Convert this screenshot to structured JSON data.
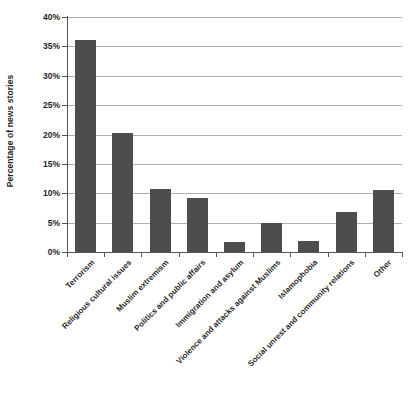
{
  "chart_data": {
    "type": "bar",
    "title": "",
    "subtitle": "",
    "xlabel": "",
    "ylabel": "Percentage of news stories",
    "ylim": [
      0,
      40
    ],
    "ytick_values": [
      0,
      5,
      10,
      15,
      20,
      25,
      30,
      35,
      40
    ],
    "ytick_labels": [
      "0%",
      "5%",
      "10%",
      "15%",
      "20%",
      "25%",
      "30%",
      "35%",
      "40%"
    ],
    "grid": true,
    "grid_axis": "y",
    "legend": false,
    "legend_position": "none",
    "bar_color": "#4d4d4d",
    "gridline_color": "#b0b0b0",
    "axis_color": "#555555",
    "categories": [
      "Terrorism",
      "Religious cultural issues",
      "Muslim extremism",
      "Politics and public affairs",
      "Immigration and asylum",
      "Violence and attacks against Muslims",
      "Islamophobia",
      "Social unrest and community relations",
      "Other"
    ],
    "values": [
      36.1,
      20.2,
      10.7,
      9.2,
      1.7,
      5.0,
      1.9,
      6.8,
      10.5
    ],
    "value_unit": "%"
  }
}
